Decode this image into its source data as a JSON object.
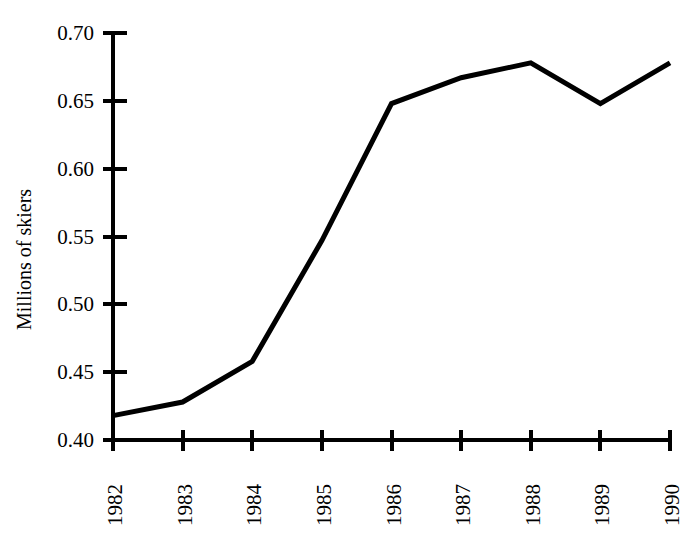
{
  "chart_data": {
    "type": "line",
    "title": "",
    "xlabel": "",
    "ylabel": "Millions of skiers",
    "categories": [
      "1982",
      "1983",
      "1984",
      "1985",
      "1986",
      "1987",
      "1988",
      "1989",
      "1990"
    ],
    "x": [
      1982,
      1983,
      1984,
      1985,
      1986,
      1987,
      1988,
      1989,
      1990
    ],
    "values": [
      0.418,
      0.428,
      0.458,
      0.547,
      0.648,
      0.667,
      0.678,
      0.648,
      0.678
    ],
    "ylim": [
      0.4,
      0.7
    ],
    "yticks": [
      "0.40",
      "0.45",
      "0.50",
      "0.55",
      "0.60",
      "0.65",
      "0.70"
    ],
    "ytick_values": [
      0.4,
      0.45,
      0.5,
      0.55,
      0.6,
      0.65,
      0.7
    ],
    "xlim": [
      1982,
      1990
    ],
    "grid": false,
    "legend": false,
    "legend_position": "none",
    "series": [
      {
        "name": "Millions of skiers",
        "color": "#000000",
        "values": [
          0.418,
          0.428,
          0.458,
          0.547,
          0.648,
          0.667,
          0.678,
          0.648,
          0.678
        ]
      }
    ],
    "line_color": "#000000",
    "background_color": "#ffffff",
    "axis_color": "#000000"
  },
  "axes": {
    "y_title": "Millions of skiers",
    "y_tick_labels": [
      "0.70",
      "0.65",
      "0.60",
      "0.55",
      "0.50",
      "0.45",
      "0.40"
    ],
    "x_tick_labels": [
      "1982",
      "1983",
      "1984",
      "1985",
      "1986",
      "1987",
      "1988",
      "1989",
      "1990"
    ]
  }
}
